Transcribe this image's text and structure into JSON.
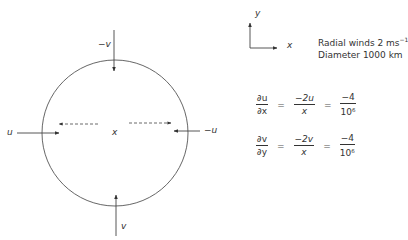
{
  "diagram": {
    "center_label": "x",
    "arrows": {
      "top_label": "−v",
      "bottom_label": "v",
      "left_label": "u",
      "right_label": "−u"
    },
    "axes": {
      "y_label": "y",
      "x_label": "x"
    },
    "notes": {
      "line1": "Radial winds 2 ms",
      "line1_sup": "−1",
      "line2": "Diameter 1000 km"
    },
    "equations": [
      {
        "lhs_num": "∂u",
        "lhs_den": "∂x",
        "op1": "=",
        "mid_num": "−2u",
        "mid_den": "x",
        "op2": "=",
        "rhs_num": "−4",
        "rhs_den_base": "10",
        "rhs_den_exp": "6"
      },
      {
        "lhs_num": "∂v",
        "lhs_den": "∂y",
        "op1": "=",
        "mid_num": "−2v",
        "mid_den": "x",
        "op2": "=",
        "rhs_num": "−4",
        "rhs_den_base": "10",
        "rhs_den_exp": "6"
      }
    ],
    "colors": {
      "stroke": "#444444",
      "text": "#333333",
      "background": "#ffffff"
    }
  }
}
